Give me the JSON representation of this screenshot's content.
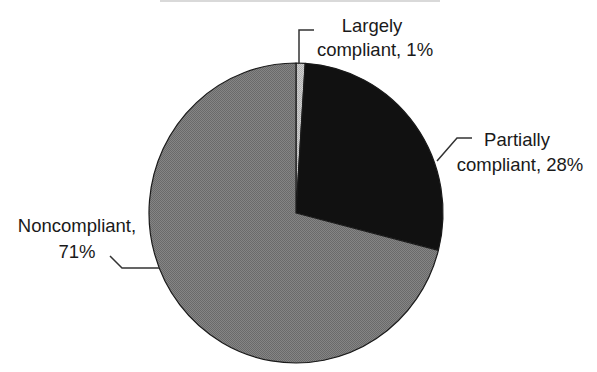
{
  "chart_data": {
    "type": "pie",
    "title": "",
    "title_note": "Title is cropped off at the top edge of the image; only faint fragments visible",
    "start_angle": "12 o'clock",
    "direction": "clockwise",
    "slices": [
      {
        "label": "Largely compliant",
        "value": 1,
        "display": "Largely compliant, 1%",
        "color": "#c4c4c4"
      },
      {
        "label": "Partially compliant",
        "value": 28,
        "display": "Partially compliant, 28%",
        "color": "#111111"
      },
      {
        "label": "Noncompliant",
        "value": 71,
        "display": "Noncompliant, 71%",
        "color": "#7d7d7d"
      }
    ],
    "legend": "none (leader-line labels)",
    "grid": false
  },
  "labels": {
    "largely": {
      "line1": "Largely",
      "line2": "compliant, 1%"
    },
    "partially": {
      "line1": "Partially",
      "line2": "compliant, 28%"
    },
    "noncompliant": {
      "line1": "Noncompliant,",
      "line2": "71%"
    }
  },
  "colors": {
    "outline": "#1a1a1a",
    "leader": "#333333"
  }
}
